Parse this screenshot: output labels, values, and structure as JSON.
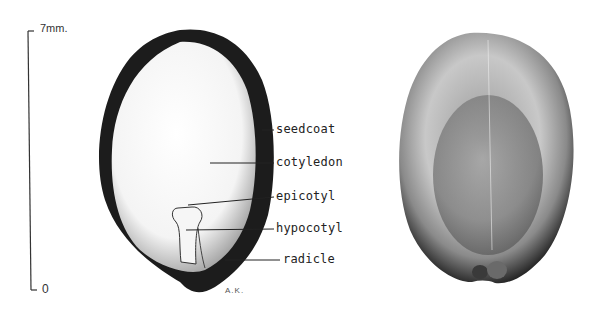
{
  "scale_bar": {
    "top_label": "7mm.",
    "bottom_label": "0"
  },
  "section_view": {
    "labels": [
      {
        "id": "seedcoat",
        "text": "seedcoat"
      },
      {
        "id": "cotyledon",
        "text": "cotyledon"
      },
      {
        "id": "epicotyl",
        "text": "epicotyl"
      },
      {
        "id": "hypocotyl",
        "text": "hypocotyl"
      },
      {
        "id": "radicle",
        "text": "radicle"
      }
    ]
  },
  "signature": "A.K.",
  "colors": {
    "ink": "#1a1a1a",
    "paper": "#ffffff"
  }
}
